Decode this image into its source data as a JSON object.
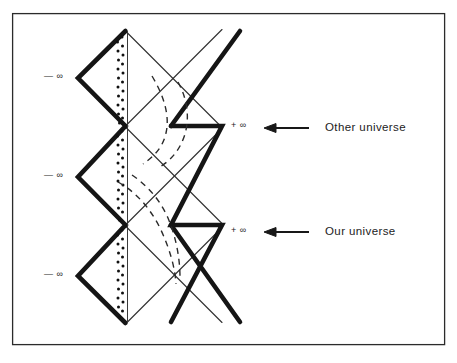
{
  "figure": {
    "kind": "penrose-conformal-diagram",
    "background_color": "#ffffff",
    "ink_color": "#1a1a1a",
    "frame": {
      "name": "figure-border",
      "x": 12,
      "y": 13,
      "width": 433,
      "height": 332,
      "stroke_color": "#2b2b2b",
      "stroke_width": 1.2
    }
  },
  "labels": {
    "minus_infinity": "— ∞",
    "plus_infinity": "+ ∞",
    "other_universe": "Other universe",
    "our_universe": "Our universe"
  },
  "left_infinity_markers": [
    {
      "name": "minus-infinity-top",
      "text": "— ∞",
      "x": 44,
      "y": 72
    },
    {
      "name": "minus-infinity-middle",
      "text": "— ∞",
      "x": 44,
      "y": 171
    },
    {
      "name": "minus-infinity-bottom",
      "text": "— ∞",
      "x": 44,
      "y": 270
    }
  ],
  "right_infinity_markers": [
    {
      "name": "plus-infinity-other-universe",
      "text": "+ ∞",
      "x": 231,
      "y": 120
    },
    {
      "name": "plus-infinity-our-universe",
      "text": "+ ∞",
      "x": 231,
      "y": 226
    }
  ],
  "callouts": [
    {
      "name": "callout-other-universe",
      "text": "Other universe",
      "text_x": 325,
      "text_y": 122,
      "arrow_x1": 308,
      "arrow_x2": 265,
      "arrow_y": 128
    },
    {
      "name": "callout-our-universe",
      "text": "Our universe",
      "text_x": 325,
      "text_y": 226,
      "arrow_x1": 308,
      "arrow_x2": 265,
      "arrow_y": 232
    }
  ],
  "geometry": {
    "center_x": 125.5,
    "left_x": 78,
    "right_x": 222,
    "apex_top_y": 32,
    "apex_bottom_y": 322,
    "crossings_y": [
      126,
      225
    ],
    "left_vertices_y": [
      78,
      177,
      276
    ],
    "right_vertices_y": [
      126,
      225
    ],
    "thick_stroke": 4.6,
    "thin_stroke": 1.1,
    "dash_stroke": 1.4
  },
  "elements": {
    "singularity_label": "singularity (stippled vertical boundary)",
    "horizon_label": "event horizons (thin diagonal null lines)",
    "worldline_label": "dashed infalling worldlines"
  }
}
